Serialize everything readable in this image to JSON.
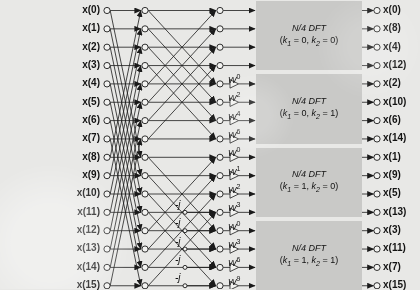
{
  "figure": {
    "kind": "fft-butterfly-signal-flow-graph",
    "radix": "radix-4 / split decomposition",
    "n_points": 16,
    "stage_count": 3,
    "background_color": "#e8e8e6",
    "box_color": "#c9c9c7",
    "line_color": "#1a1a1a"
  },
  "inputs": {
    "count": 16,
    "labels": [
      "x(0)",
      "x(1)",
      "x(2)",
      "x(3)",
      "x(4)",
      "x(5)",
      "x(6)",
      "x(7)",
      "x(8)",
      "x(9)",
      "x(10)",
      "x(11)",
      "x(12)",
      "x(13)",
      "x(14)",
      "x(15)"
    ]
  },
  "outputs": {
    "count": 16,
    "labels": [
      "x(0)",
      "x(8)",
      "x(4)",
      "x(12)",
      "x(2)",
      "x(10)",
      "x(6)",
      "x(14)",
      "x(1)",
      "x(9)",
      "x(5)",
      "x(13)",
      "x(3)",
      "x(11)",
      "x(7)",
      "x(15)"
    ]
  },
  "twiddles": {
    "symbol": "W",
    "rows": [
      {
        "row": 4,
        "label": "W",
        "exponent": "0"
      },
      {
        "row": 5,
        "label": "W",
        "exponent": "2"
      },
      {
        "row": 6,
        "label": "W",
        "exponent": "4"
      },
      {
        "row": 7,
        "label": "W",
        "exponent": "6"
      },
      {
        "row": 8,
        "label": "W",
        "exponent": "0"
      },
      {
        "row": 9,
        "label": "W",
        "exponent": "1"
      },
      {
        "row": 10,
        "label": "W",
        "exponent": "2"
      },
      {
        "row": 11,
        "label": "W",
        "exponent": "3"
      },
      {
        "row": 12,
        "label": "W",
        "exponent": "0"
      },
      {
        "row": 13,
        "label": "W",
        "exponent": "3"
      },
      {
        "row": 14,
        "label": "W",
        "exponent": "6"
      },
      {
        "row": 15,
        "label": "W",
        "exponent": "9"
      }
    ]
  },
  "minus_j_multipliers": {
    "text": "-j",
    "rows": [
      11,
      12,
      13,
      14,
      15
    ]
  },
  "dft_blocks": [
    {
      "title": "N/4 DFT",
      "params": "(k1 = 0, k2 = 0)",
      "k1": "0",
      "k2": "0"
    },
    {
      "title": "N/4 DFT",
      "params": "(k1 = 0, k2 = 1)",
      "k1": "0",
      "k2": "1"
    },
    {
      "title": "N/4 DFT",
      "params": "(k1 = 1, k2 = 0)",
      "k1": "1",
      "k2": "0"
    },
    {
      "title": "N/4 DFT",
      "params": "(k1 = 1, k2 = 1)",
      "k1": "1",
      "k2": "1"
    }
  ],
  "chart_data": {
    "type": "diagram",
    "xlabel": "",
    "ylabel": ""
  }
}
